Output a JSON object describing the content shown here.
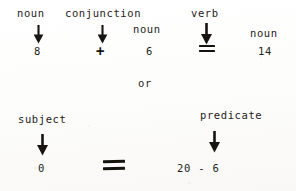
{
  "diagram": {
    "connector": "or",
    "ink_color": "#1d1a18",
    "paper_color": "#ffffff",
    "rows": [
      {
        "id": "sentence-row",
        "labels": [
          {
            "id": "noun-1",
            "text": "noun"
          },
          {
            "id": "conjunction-1",
            "text": "conjunction"
          },
          {
            "id": "noun-2",
            "text": "noun"
          },
          {
            "id": "verb-1",
            "text": "verb"
          },
          {
            "id": "noun-3",
            "text": "noun"
          }
        ],
        "values": [
          {
            "id": "value-8",
            "text": "8"
          },
          {
            "id": "operator-plus",
            "text": "+"
          },
          {
            "id": "value-6",
            "text": "6"
          },
          {
            "id": "operator-equals",
            "text": "="
          },
          {
            "id": "value-14",
            "text": "14"
          }
        ]
      },
      {
        "id": "subject-predicate-row",
        "labels": [
          {
            "id": "subject",
            "text": "subject"
          },
          {
            "id": "predicate",
            "text": "predicate"
          }
        ],
        "values": [
          {
            "id": "value-0",
            "text": "0"
          },
          {
            "id": "operator-equals-2",
            "text": "="
          },
          {
            "id": "expression-20-6",
            "text": "20 - 6"
          }
        ]
      }
    ],
    "arrows": [
      {
        "id": "arrow-noun-1",
        "points_from": "noun",
        "points_to": "8"
      },
      {
        "id": "arrow-conj-1",
        "points_from": "conjunction",
        "points_to": "+"
      },
      {
        "id": "arrow-verb-1",
        "points_from": "verb",
        "points_to": "="
      },
      {
        "id": "arrow-subject",
        "points_from": "subject",
        "points_to": "0"
      },
      {
        "id": "arrow-predicate",
        "points_from": "predicate",
        "points_to": "20 - 6"
      }
    ]
  }
}
